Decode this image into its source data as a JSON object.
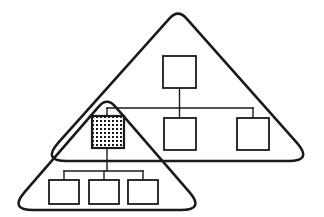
{
  "canvas": {
    "width": 324,
    "height": 217,
    "background": "#ffffff"
  },
  "style": {
    "stroke": "#1a1a1a",
    "domain_stroke_width": 2.6,
    "node_stroke_width": 1.8,
    "edge_stroke_width": 1.4,
    "node_fill": "#ffffff",
    "shaded_node_fill": "#ffffff",
    "hatch_dot_color": "#1a1a1a"
  },
  "domains": [
    {
      "id": "upper-domain",
      "name": "upper-triangle-domain",
      "label": "",
      "apex": {
        "x": 178,
        "y": 9
      },
      "bottom_left": {
        "x": 42,
        "y": 161
      },
      "bottom_right": {
        "x": 313,
        "y": 161
      },
      "corner_radius": 11,
      "points": "178,9 313,161 42,161"
    },
    {
      "id": "lower-domain",
      "name": "lower-triangle-domain",
      "label": "",
      "apex": {
        "x": 107,
        "y": 97
      },
      "bottom_left": {
        "x": 9,
        "y": 210
      },
      "bottom_right": {
        "x": 205,
        "y": 210
      },
      "corner_radius": 11,
      "points": "107,97 205,210 9,210"
    }
  ],
  "nodes": [
    {
      "id": "node-root",
      "name": "node-root",
      "label": "",
      "x": 163,
      "y": 56,
      "width": 33,
      "height": 32,
      "shaded": false,
      "domain": "upper-domain"
    },
    {
      "id": "node-upper-mid",
      "name": "node-upper-middle",
      "label": "",
      "x": 164,
      "y": 118,
      "width": 32,
      "height": 32,
      "shaded": false,
      "domain": "upper-domain"
    },
    {
      "id": "node-upper-right",
      "name": "node-upper-right",
      "label": "",
      "x": 237,
      "y": 118,
      "width": 32,
      "height": 32,
      "shaded": false,
      "domain": "upper-domain"
    },
    {
      "id": "node-shared",
      "name": "node-shared-gateway",
      "label": "",
      "x": 92,
      "y": 116,
      "width": 32,
      "height": 32,
      "shaded": true,
      "domain": "both"
    },
    {
      "id": "node-leaf-left",
      "name": "node-leaf-left",
      "label": "",
      "x": 49,
      "y": 180,
      "width": 30,
      "height": 24,
      "shaded": false,
      "domain": "lower-domain"
    },
    {
      "id": "node-leaf-middle",
      "name": "node-leaf-middle",
      "label": "",
      "x": 89,
      "y": 180,
      "width": 30,
      "height": 24,
      "shaded": false,
      "domain": "lower-domain"
    },
    {
      "id": "node-leaf-right",
      "name": "node-leaf-right",
      "label": "",
      "x": 128,
      "y": 180,
      "width": 30,
      "height": 24,
      "shaded": false,
      "domain": "lower-domain"
    }
  ],
  "edges": [
    {
      "id": "edge-root-bus",
      "name": "edge-root-to-bus",
      "path": "M 179.5 88 L 179.5 108"
    },
    {
      "id": "edge-upper-bus",
      "name": "edge-upper-bus-horizontal",
      "path": "M 107 108 L 253 108"
    },
    {
      "id": "edge-bus-shared",
      "name": "edge-bus-to-shared-node",
      "path": "M 107 108 L 107 116"
    },
    {
      "id": "edge-bus-upper-mid",
      "name": "edge-bus-to-upper-middle",
      "path": "M 179.5 108 L 179.5 118"
    },
    {
      "id": "edge-bus-upper-right",
      "name": "edge-bus-to-upper-right",
      "path": "M 253 108 L 253 118"
    },
    {
      "id": "edge-shared-lower-bus",
      "name": "edge-shared-node-to-lower-bus",
      "path": "M 107 148 L 107 171"
    },
    {
      "id": "edge-lower-bus",
      "name": "edge-lower-bus-horizontal",
      "path": "M 64 171 L 143 171"
    },
    {
      "id": "edge-bus-leaf-left",
      "name": "edge-bus-to-leaf-left",
      "path": "M 64 171 L 64 180"
    },
    {
      "id": "edge-bus-leaf-middle",
      "name": "edge-bus-to-leaf-middle",
      "path": "M 104 171 L 104 180"
    },
    {
      "id": "edge-bus-leaf-right",
      "name": "edge-bus-to-leaf-right",
      "path": "M 143 171 L 143 180"
    }
  ]
}
